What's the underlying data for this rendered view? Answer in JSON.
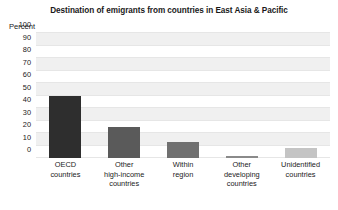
{
  "chart_data": {
    "type": "bar",
    "title": "Destination of emigrants from countries in East Asia & Pacific",
    "xlabel": "",
    "ylabel": "Percent",
    "ylim": [
      0,
      100
    ],
    "yticks": [
      100,
      90,
      80,
      70,
      60,
      50,
      40,
      30,
      20,
      10,
      0
    ],
    "grid": true,
    "grid_style": "alternating-horizontal-bands",
    "legend": "none",
    "categories": [
      "OECD countries",
      "Other high-income countries",
      "Within region",
      "Other developing countries",
      "Unidentified countries"
    ],
    "category_lines": [
      [
        "OECD",
        "countries"
      ],
      [
        "Other",
        "high-income",
        "countries"
      ],
      [
        "Within",
        "region"
      ],
      [
        "Other",
        "developing",
        "countries"
      ],
      [
        "Unidentified",
        "countries"
      ]
    ],
    "values": [
      50,
      25,
      13,
      1,
      8
    ],
    "bar_colors": [
      "#2e2e2e",
      "#5a5a5a",
      "#707070",
      "#8a8a8a",
      "#c4c4c4"
    ]
  },
  "style": {
    "plot_background": "#ffffff",
    "band_color": "#f0f0f0",
    "text_color": "#1a1a1a",
    "page_background": "#ffffff"
  }
}
